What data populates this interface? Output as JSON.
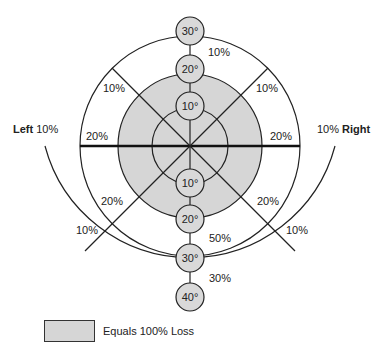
{
  "diagram": {
    "type": "visual-field-loss-chart",
    "center": {
      "x": 190,
      "y": 146
    },
    "colors": {
      "shaded": "#d6d6d6",
      "line": "#222222",
      "background": "#ffffff"
    },
    "side_labels": {
      "left": {
        "word": "Left",
        "value": "10%"
      },
      "right": {
        "word": "Right",
        "value": "10%"
      }
    },
    "degree_markers_top": [
      "30°",
      "20°",
      "10°"
    ],
    "degree_markers_bottom": [
      "10°",
      "20°",
      "30°",
      "40°"
    ],
    "percent_labels": {
      "top_30_ring": "10%",
      "upper_left_ring": "10%",
      "upper_right_ring": "10%",
      "left_horizontal": "20%",
      "right_horizontal": "20%",
      "lower_left_inner": "20%",
      "lower_right_inner": "20%",
      "lower_left_outer": "10%",
      "lower_right_outer": "10%",
      "bottom_20_30": "50%",
      "bottom_30_40": "30%"
    }
  },
  "legend": {
    "label": "Equals 100% Loss"
  }
}
